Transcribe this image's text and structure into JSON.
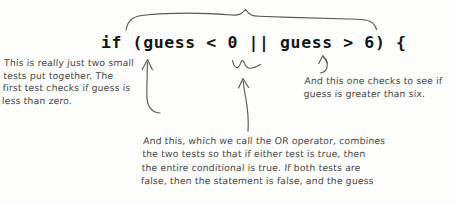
{
  "page": {
    "background_color": "#fdfdfc",
    "ink_color": "#59595a",
    "code_color": "#151515",
    "note_color": "#4a4a48"
  },
  "code": {
    "line": "if (guess < 0 || guess > 6) {"
  },
  "annotations": {
    "left": {
      "text": "This is really just two small\ntests put together. The\nfirst test checks if guess is\nless than zero."
    },
    "right": {
      "text": "And this one checks to see if\nguess is greater than six."
    },
    "bottom": {
      "text": "And this, which we call the OR operator, combines\nthe two tests so that if either test is true, then\nthe entire conditional is true. If both tests are\nfalse, then the statement is false, and the guess"
    }
  },
  "markings": {
    "top_brace": "hand-drawn-curly-brace-over-condition",
    "left_arrow": "curved-arrow-pointing-to-first-test",
    "middle_squiggle": "squiggly-underline-under-or-operator",
    "middle_arrow": "long-vertical-arrow-pointing-to-or-operator",
    "right_arrow": "short-hook-arrow-pointing-to-second-test"
  }
}
